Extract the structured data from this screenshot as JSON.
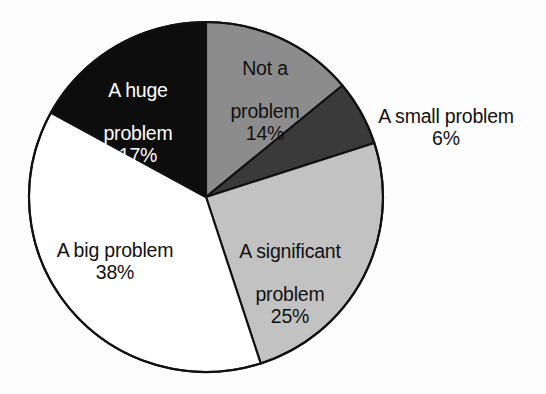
{
  "chart_data": {
    "type": "pie",
    "title": "",
    "subtitle": "",
    "xlabel": "",
    "ylabel": "",
    "legend_position": "none",
    "grid": false,
    "units": "percent",
    "start_angle_deg": -90,
    "direction": "clockwise",
    "categories": [
      "Not a problem",
      "A small problem",
      "A significant problem",
      "A big problem",
      "A huge problem"
    ],
    "values": [
      14,
      6,
      25,
      38,
      17
    ],
    "slices": [
      {
        "label": "Not a problem",
        "label_line1": "Not a",
        "label_line2": "problem",
        "value": 14,
        "value_text": "14%",
        "color": "#8c8c8c",
        "text_color": "#111111",
        "label_placement": "inside",
        "start_deg": -90,
        "end_deg": -39.6
      },
      {
        "label": "A small problem",
        "label_line1": "A small problem",
        "label_line2": "",
        "value": 6,
        "value_text": "6%",
        "color": "#3a3a3a",
        "text_color": "#111111",
        "label_placement": "outside",
        "start_deg": -39.6,
        "end_deg": -18.0
      },
      {
        "label": "A significant problem",
        "label_line1": "A significant",
        "label_line2": "problem",
        "value": 25,
        "value_text": "25%",
        "color": "#c2c2c2",
        "text_color": "#111111",
        "label_placement": "inside",
        "start_deg": -18.0,
        "end_deg": 72.0
      },
      {
        "label": "A big problem",
        "label_line1": "A big problem",
        "label_line2": "",
        "value": 38,
        "value_text": "38%",
        "color": "#ffffff",
        "text_color": "#111111",
        "label_placement": "inside",
        "start_deg": 72.0,
        "end_deg": 208.8
      },
      {
        "label": "A huge problem",
        "label_line1": "A huge",
        "label_line2": "problem",
        "value": 17,
        "value_text": "17%",
        "color": "#0d0d0d",
        "text_color": "#ffffff",
        "label_placement": "inside",
        "start_deg": 208.8,
        "end_deg": 270.0
      }
    ],
    "background_color": "#fdfdfd",
    "outline_color": "#111111",
    "center_x": 206,
    "center_y": 197,
    "radius_x": 177,
    "radius_y": 175
  }
}
